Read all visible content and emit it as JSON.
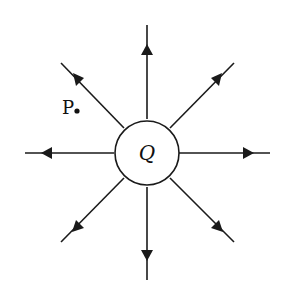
{
  "diagram": {
    "charge_label": "Q",
    "point_label": "P",
    "line_color": "#1a1a1a",
    "background": "#ffffff",
    "field_line_count": 8,
    "field_direction": "outward"
  }
}
